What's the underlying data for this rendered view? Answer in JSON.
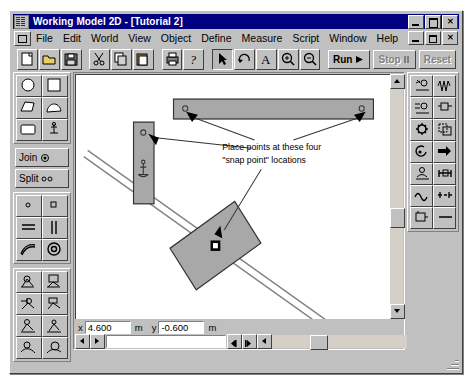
{
  "window": {
    "title": "Working Model 2D - [Tutorial 2]",
    "app_icon": "working-model-icon",
    "buttons": {
      "minimize": "_",
      "maximize": "□",
      "close": "✕"
    },
    "mdi_buttons": {
      "minimize": "_",
      "restore": "❐",
      "close": "✕"
    }
  },
  "menubar": {
    "items": [
      {
        "label": "File"
      },
      {
        "label": "Edit"
      },
      {
        "label": "World"
      },
      {
        "label": "View"
      },
      {
        "label": "Object"
      },
      {
        "label": "Define"
      },
      {
        "label": "Measure"
      },
      {
        "label": "Script"
      },
      {
        "label": "Window"
      },
      {
        "label": "Help"
      }
    ]
  },
  "toolbar": {
    "items": [
      {
        "name": "new-file-button",
        "icon": "new-document-icon"
      },
      {
        "name": "open-file-button",
        "icon": "open-folder-icon"
      },
      {
        "name": "save-file-button",
        "icon": "floppy-disk-icon"
      },
      {
        "name": "cut-button",
        "icon": "scissors-icon"
      },
      {
        "name": "copy-button",
        "icon": "copy-icon"
      },
      {
        "name": "paste-button",
        "icon": "clipboard-icon"
      },
      {
        "name": "print-button",
        "icon": "printer-icon"
      },
      {
        "name": "help-button",
        "icon": "question-mark-icon"
      },
      {
        "name": "arrow-tool-button",
        "icon": "arrow-pointer-icon"
      },
      {
        "name": "rotate-tool-button",
        "icon": "rotate-icon"
      },
      {
        "name": "text-tool-button",
        "icon": "text-a-icon"
      },
      {
        "name": "zoom-in-tool-button",
        "icon": "magnifier-plus-icon"
      },
      {
        "name": "zoom-out-tool-button",
        "icon": "magnifier-minus-icon"
      }
    ],
    "run_label": "Run",
    "stop_label": "Stop",
    "reset_label": "Reset"
  },
  "left_palette": {
    "shape_tools": [
      {
        "name": "circle-tool",
        "icon": "circle-icon"
      },
      {
        "name": "rectangle-tool",
        "icon": "square-icon"
      },
      {
        "name": "polygon-tool",
        "icon": "polygon-icon"
      },
      {
        "name": "curved-polygon-tool",
        "icon": "curved-shape-icon"
      },
      {
        "name": "rounded-rect-tool",
        "icon": "rounded-rectangle-icon"
      },
      {
        "name": "anchor-tool",
        "icon": "anchor-icon"
      }
    ],
    "join_label": "Join",
    "split_label": "Split",
    "constraint_tools": [
      {
        "name": "point-element-tool",
        "icon": "small-dot-icon"
      },
      {
        "name": "square-point-tool",
        "icon": "small-square-icon"
      },
      {
        "name": "horizontal-slot-tool",
        "icon": "double-horizontal-line-icon"
      },
      {
        "name": "vertical-slot-tool",
        "icon": "double-vertical-line-icon"
      },
      {
        "name": "curved-slot-tool",
        "icon": "arc-slot-icon"
      },
      {
        "name": "pulley-tool",
        "icon": "concentric-circle-icon"
      }
    ],
    "actuator_tools": [
      {
        "name": "motor-tool",
        "icon": "motor-icon"
      },
      {
        "name": "rotational-spring-tool",
        "icon": "rotational-spring-icon"
      },
      {
        "name": "actuator-tool",
        "icon": "actuator-icon"
      },
      {
        "name": "rotational-damper-tool",
        "icon": "rotational-damper-icon"
      },
      {
        "name": "spring-tool",
        "icon": "spring-icon"
      },
      {
        "name": "damper-tool",
        "icon": "damper-icon"
      },
      {
        "name": "rope-tool",
        "icon": "rope-icon"
      },
      {
        "name": "separator-tool",
        "icon": "separator-icon"
      }
    ]
  },
  "right_palette": {
    "tools": [
      {
        "name": "gravity-tool",
        "icon": "gravity-icon"
      },
      {
        "name": "force-field-tool",
        "icon": "wave-icon"
      },
      {
        "name": "air-resistance-tool",
        "icon": "air-resistance-icon"
      },
      {
        "name": "electrostatics-tool",
        "icon": "electrostatics-icon"
      },
      {
        "name": "simulation-settings-tool",
        "icon": "gear-icon"
      },
      {
        "name": "copy-geometry-tool",
        "icon": "duplicate-shape-icon"
      },
      {
        "name": "torque-tool",
        "icon": "torque-icon"
      },
      {
        "name": "force-vector-tool",
        "icon": "right-arrow-icon"
      },
      {
        "name": "position-meter-tool",
        "icon": "position-meter-icon"
      },
      {
        "name": "constraint-meter-tool",
        "icon": "constraint-meter-icon"
      },
      {
        "name": "velocity-graph-tool",
        "icon": "sine-wave-icon"
      },
      {
        "name": "acceleration-meter-tool",
        "icon": "plus-minus-icon"
      },
      {
        "name": "output-meter-tool",
        "icon": "output-box-icon"
      },
      {
        "name": "line-tool",
        "icon": "horizontal-line-icon"
      }
    ]
  },
  "canvas": {
    "annotation": {
      "line1": "Place points at these four",
      "line2": "\"snap point\" locations"
    },
    "bodies": [
      {
        "name": "horizontal-bar",
        "kind": "rectangle"
      },
      {
        "name": "vertical-bar",
        "kind": "rectangle",
        "has_anchor": true
      },
      {
        "name": "diamond-block",
        "kind": "rotated-rectangle",
        "has_center-of-mass": true
      },
      {
        "name": "diagonal-slot",
        "kind": "slot-track"
      }
    ],
    "snap_points": [
      {
        "name": "snap-point-horizontal-bar-left"
      },
      {
        "name": "snap-point-horizontal-bar-right"
      },
      {
        "name": "snap-point-vertical-bar-top"
      },
      {
        "name": "snap-point-diamond-block"
      }
    ]
  },
  "status": {
    "x_label": "x",
    "x_value": "4.600",
    "x_unit": "m",
    "y_label": "y",
    "y_value": "-0.600",
    "y_unit": "m"
  },
  "colors": {
    "titlebar": "#000080",
    "face": "#c0c0c0",
    "canvas": "#ffffff",
    "body_fill": "#a0a0a0"
  }
}
